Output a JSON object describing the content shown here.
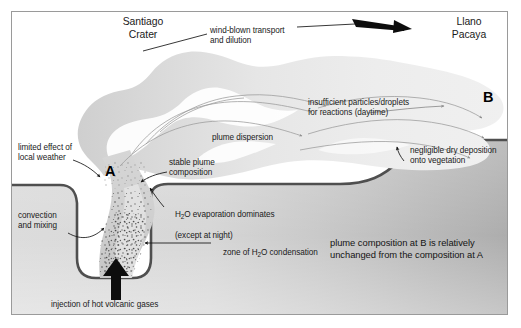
{
  "figure": {
    "type": "volcanic-plume-dispersion-schematic",
    "width": 521,
    "height": 328
  },
  "places": {
    "crater": "Santiago\nCrater",
    "plateau": "Llano\nPacaya"
  },
  "markers": {
    "a": "A",
    "b": "B"
  },
  "annotations": {
    "wind": "wind-blown transport\nand dilution",
    "limited_weather": "limited effect of\nlocal weather",
    "stable_plume": "stable plume\ncomposition",
    "plume_dispersion": "plume dispersion",
    "insufficient_particles": "insufficient particles/droplets\nfor reactions (daytime)",
    "negligible_deposition": "negligible dry deposition\nonto vegetation",
    "evaporation": "H2O evaporation dominates\n(except at night)",
    "evaporation_pre": "H",
    "evaporation_sub": "2",
    "evaporation_post": "O evaporation dominates",
    "evaporation_line2": "(except at night)",
    "condensation_pre": "zone of H",
    "condensation_sub": "2",
    "condensation_post": "O condensation",
    "convection": "convection\nand mixing",
    "injection": "injection of hot volcanic gases",
    "summary": "plume composition at B is relatively\nunchanged from the composition at A"
  },
  "colors": {
    "plume_near": "#d2d2d2",
    "plume_far": "#e9e9e9",
    "ground_fill_light": "#d9d9d9",
    "ground_fill_dark": "#b4b4b4",
    "ground_line": "#4a4a4a",
    "frame": "#9a9a9a",
    "text": "#1a1a1a",
    "arrow": "#111111",
    "flow_arrow": "#8d8d8d",
    "background": "#ffffff"
  }
}
